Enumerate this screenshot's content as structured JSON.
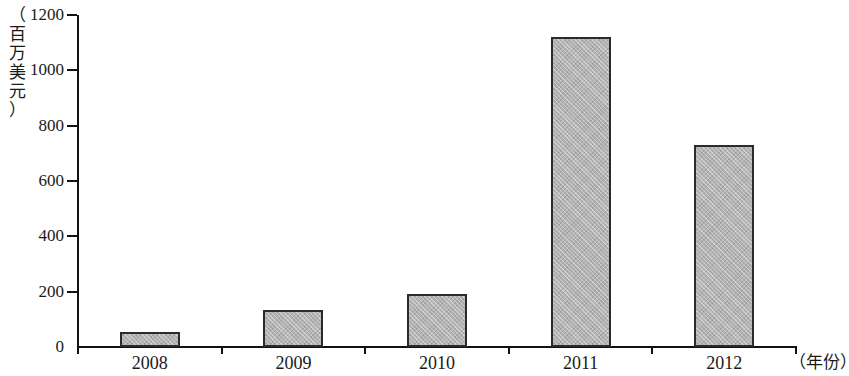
{
  "chart_data": {
    "type": "bar",
    "title": "",
    "subtitle": "",
    "xlabel": "（年份）",
    "ylabel": "（百万美元）",
    "categories": [
      "2008",
      "2009",
      "2010",
      "2011",
      "2012"
    ],
    "values": [
      55,
      133,
      193,
      1120,
      730
    ],
    "series": [
      {
        "name": "",
        "values": [
          55,
          133,
          193,
          1120,
          730
        ]
      }
    ],
    "ylim": [
      0,
      1200
    ],
    "y_ticks": [
      "0",
      "200",
      "400",
      "600",
      "800",
      "1000",
      "1200"
    ],
    "y_tick_values": [
      0,
      200,
      400,
      600,
      800,
      1000,
      1200
    ],
    "grid": false,
    "legend": false,
    "legend_position": "none",
    "bar_fill_color": "#b3b3b3",
    "bar_border_color": "#2b2b2b",
    "axis_color": "#111111",
    "background_color": "#ffffff"
  },
  "axis_caption_chars": {
    "y": [
      "（",
      "百",
      "万",
      "美",
      "元",
      "）"
    ]
  }
}
